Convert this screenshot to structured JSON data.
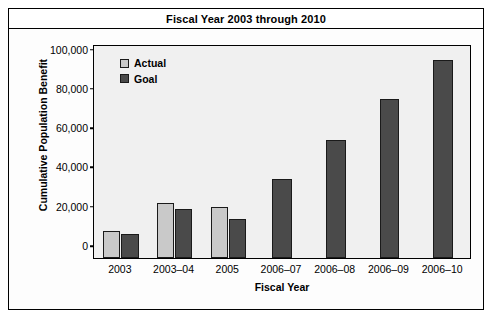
{
  "chart_data": {
    "type": "bar",
    "title": "Fiscal Year 2003 through 2010",
    "xlabel": "Fiscal Year",
    "ylabel": "Cumulative Population Benefit",
    "categories": [
      "2003",
      "2003–04",
      "2005",
      "2006–07",
      "2006–08",
      "2006–09",
      "2006–10"
    ],
    "series": [
      {
        "name": "Actual",
        "color": "#c9c9c9",
        "values": [
          14000,
          28000,
          26000,
          null,
          null,
          null,
          null
        ]
      },
      {
        "name": "Goal",
        "color": "#4a4a4a",
        "values": [
          12000,
          25000,
          20000,
          40000,
          60000,
          81000,
          101000
        ]
      }
    ],
    "ylim": [
      0,
      108000
    ],
    "yticks": [
      0,
      20000,
      40000,
      60000,
      80000,
      100000
    ],
    "ytick_labels": [
      "0",
      "20,000",
      "40,000",
      "60,000",
      "80,000",
      "100,000"
    ],
    "grid": false,
    "legend_position": "top-left",
    "plot_background": "#f0f0f0"
  },
  "legend": {
    "items": [
      {
        "label": "Actual",
        "swatch": "actual"
      },
      {
        "label": "Goal",
        "swatch": "goal"
      }
    ]
  }
}
